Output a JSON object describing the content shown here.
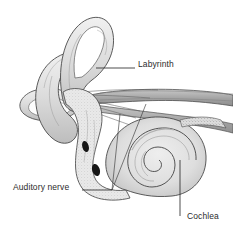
{
  "figure": {
    "background_color": "#ffffff",
    "ink_color": "#3a3a3a",
    "shade_light": "#e4e4e4",
    "shade_mid": "#c9c9c9",
    "shade_dark": "#a2a2a2",
    "window_color": "#1c1c1c",
    "width": 233,
    "height": 241
  },
  "labels": {
    "labyrinth": "Labyrinth",
    "auditory_nerve": "Auditory nerve",
    "cochlea": "Cochlea"
  },
  "parts": [
    {
      "name": "superior-semicircular-canal",
      "label": "Labyrinth"
    },
    {
      "name": "posterior-semicircular-canal",
      "label": "Labyrinth"
    },
    {
      "name": "horizontal-semicircular-canal",
      "label": "Labyrinth"
    },
    {
      "name": "vestibule",
      "label": "Labyrinth"
    },
    {
      "name": "oval-window",
      "label": ""
    },
    {
      "name": "round-window",
      "label": ""
    },
    {
      "name": "vestibulocochlear-nerve-bundle",
      "label": "Auditory nerve"
    },
    {
      "name": "cochlea-spiral",
      "label": "Cochlea"
    }
  ],
  "leaders": [
    {
      "name": "labyrinth-leader",
      "from": [
        96,
        68
      ],
      "to": [
        135,
        68
      ]
    },
    {
      "name": "auditory-nerve-leader",
      "from": [
        82,
        190
      ],
      "to": [
        112,
        190
      ]
    },
    {
      "name": "cochlea-leader",
      "from": [
        180,
        162
      ],
      "to": [
        180,
        216
      ]
    }
  ]
}
